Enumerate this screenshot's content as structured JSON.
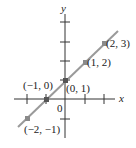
{
  "figure": {
    "axis_x_label": "x",
    "axis_y_label": "y",
    "origin_label": "0",
    "line_color": "#9a9a9a",
    "point_color": "#8a8a8a",
    "points": [
      {
        "label": "(2, 3)",
        "x": 2,
        "y": 3
      },
      {
        "label": "(1, 2)",
        "x": 1,
        "y": 2
      },
      {
        "label": "(0, 1)",
        "x": 0,
        "y": 1
      },
      {
        "label": "(−1, 0)",
        "x": -1,
        "y": 0
      },
      {
        "label": "(−2, −1)",
        "x": -2,
        "y": -1
      }
    ],
    "line_equation": "y = x + 1"
  }
}
